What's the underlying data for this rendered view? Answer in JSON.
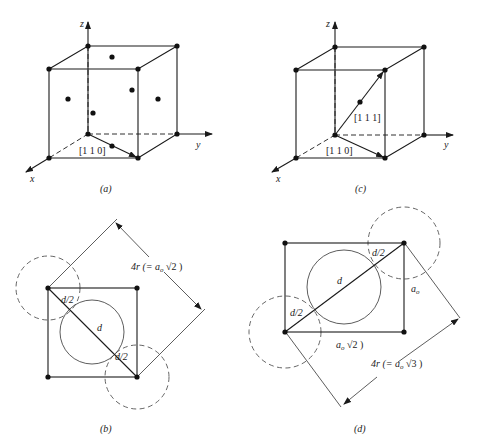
{
  "panels": {
    "a": {
      "caption": "(a)",
      "axes": {
        "x": "x",
        "y": "y",
        "z": "z"
      },
      "direction_label": "[1 1 0]"
    },
    "b": {
      "caption": "(b)",
      "labels": {
        "d_half_top": "d/2",
        "d": "d",
        "d_half_bottom": "d/2"
      },
      "dimension": {
        "prefix": "4r (= a",
        "sub": "o",
        "suffix": " √2 )"
      }
    },
    "c": {
      "caption": "(c)",
      "axes": {
        "x": "x",
        "y": "y",
        "z": "z"
      },
      "direction_label_1": "[1 1 1]",
      "direction_label_2": "[1 1 0]"
    },
    "d": {
      "caption": "(d)",
      "labels": {
        "d_half_top": "d/2",
        "d": "d",
        "d_half_bottom": "d/2"
      },
      "side_label": {
        "main": "a",
        "sub": "o"
      },
      "bottom_label": {
        "main": "a",
        "sub": "o",
        "suffix": " √2 )"
      },
      "dimension": {
        "prefix": "4r (= a",
        "sub": "o",
        "suffix": " √3 )"
      }
    }
  }
}
